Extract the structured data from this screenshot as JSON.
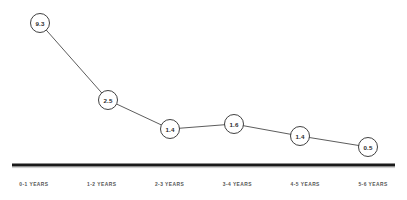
{
  "chart_data": {
    "type": "line",
    "title": "",
    "subtitle": "",
    "xlabel": "",
    "ylabel": "",
    "categories": [
      "0-1 YEARS",
      "1-2 YEARS",
      "2-3 YEARS",
      "3-4 YEARS",
      "4-5 YEARS",
      "5-6 YEARS"
    ],
    "values": [
      9.3,
      2.5,
      1.4,
      1.6,
      1.4,
      0.5
    ],
    "point_labels": [
      "9.3",
      "2.5",
      "1.4",
      "1.6",
      "1.4",
      "0.5"
    ],
    "series": [
      {
        "name": "",
        "values": [
          9.3,
          2.5,
          1.4,
          1.6,
          1.4,
          0.5
        ]
      }
    ],
    "ylim": [
      0,
      9.3
    ],
    "grid": false,
    "legend": "none",
    "annotations": [],
    "marker_style": "circle-with-value-label",
    "colors": {
      "line": "#4a4a4a",
      "marker_fill": "#ffffff",
      "marker_stroke": "#2b2b2b",
      "label_text": "#2b2b2b",
      "axis": "#1a1a1a",
      "tick_text": "#555555",
      "background": "#ffffff"
    },
    "geometry": {
      "points": [
        {
          "x": 40,
          "y": 23
        },
        {
          "x": 108,
          "y": 100
        },
        {
          "x": 170,
          "y": 129
        },
        {
          "x": 234,
          "y": 124
        },
        {
          "x": 300,
          "y": 136
        },
        {
          "x": 368,
          "y": 147
        }
      ],
      "marker_radius": 9.5,
      "baseline_y": 165,
      "baseline_x_start": 12,
      "baseline_x_end": 395
    }
  }
}
